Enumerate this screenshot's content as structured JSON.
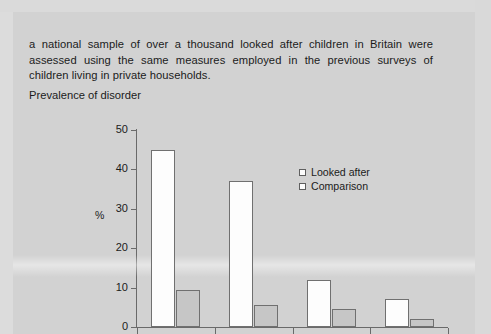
{
  "document": {
    "paragraph": "a national sample of over a thousand looked after children in Britain were assessed using the same measures employed in the previous surveys of children living in private households.",
    "caption": "Prevalence of disorder"
  },
  "chart_data": {
    "type": "bar",
    "title": "Prevalence of disorder",
    "xlabel": "",
    "ylabel": "%",
    "ylim": [
      0,
      50
    ],
    "yticks": [
      0,
      10,
      20,
      30,
      40,
      50
    ],
    "grid": false,
    "legend_position": "top-right",
    "categories": [
      "",
      "",
      "",
      ""
    ],
    "series": [
      {
        "name": "Looked after",
        "values": [
          45,
          37,
          12,
          7
        ],
        "color": "#fdfdfd"
      },
      {
        "name": "Comparison",
        "values": [
          9.5,
          5.5,
          4.5,
          2
        ],
        "color": "#c6c6c6"
      }
    ]
  },
  "legend": {
    "items": [
      {
        "label": "Looked after",
        "swatch": "legend-swatch-looked-after"
      },
      {
        "label": "Comparison",
        "swatch": "legend-swatch-comparison"
      }
    ]
  },
  "colors": {
    "page_background": "#d2d2d2",
    "text": "#1b1b1b",
    "axis": "#6a6a6a",
    "bar_looked_after": "#fdfdfd",
    "bar_comparison": "#c6c6c6"
  }
}
